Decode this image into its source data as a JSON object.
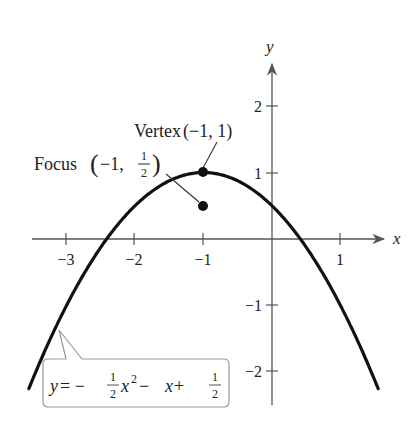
{
  "axes": {
    "x_label": "x",
    "y_label": "y",
    "x_ticks": [
      {
        "value": -3,
        "label": "−3"
      },
      {
        "value": -2,
        "label": "−2"
      },
      {
        "value": -1,
        "label": "−1"
      },
      {
        "value": 1,
        "label": "1"
      }
    ],
    "y_ticks": [
      {
        "value": 2,
        "label": "2"
      },
      {
        "value": 1,
        "label": "1"
      },
      {
        "value": -1,
        "label": "−1"
      },
      {
        "value": -2,
        "label": "−2"
      }
    ]
  },
  "annotations": {
    "vertex": {
      "text": "Vertex",
      "coords": "(−1, 1)",
      "x": -1,
      "y": 1
    },
    "focus": {
      "text": "Focus",
      "coords_prefix": "(−1, ",
      "num": "1",
      "den": "2",
      "coords_suffix": ")",
      "x": -1,
      "y": 0.5
    }
  },
  "equation": {
    "y": "y",
    "eq": " = − ",
    "frac1_num": "1",
    "frac1_den": "2",
    "x2": "x",
    "exp": "2",
    "mid": " − ",
    "x": "x",
    "plus": " + ",
    "frac2_num": "1",
    "frac2_den": "2"
  },
  "colors": {
    "curve": "#111111",
    "axis": "#555555",
    "callout_border": "#999999",
    "text": "#222222"
  }
}
